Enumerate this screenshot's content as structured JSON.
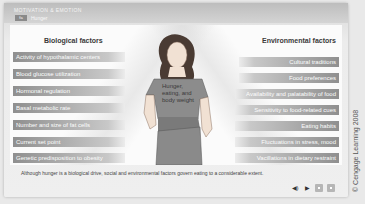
{
  "header": {
    "app_title": "Motivation & Emotion",
    "tab_badge": "fa",
    "tab_label": "Hunger"
  },
  "biological": {
    "title": "Biological factors",
    "items": [
      "Activity of hypothalamic centers",
      "Blood glucose utilization",
      "Hormonal regulation",
      "Basal metabolic rate",
      "Number and size of fat cells",
      "Current set point",
      "Genetic predisposition to obesity"
    ]
  },
  "environmental": {
    "title": "Environmental factors",
    "items": [
      "Cultural traditions",
      "Food preferences",
      "Availability and palatability of food",
      "Sensitivity to food-related cues",
      "Eating habits",
      "Fluctuations in stress, mood",
      "Vacillations in dietary restraint"
    ]
  },
  "figure": {
    "shirt_text": "Hunger, eating, and body weight"
  },
  "caption": "Although hunger is a biological drive, social and environmental factors govern eating to a considerable extent.",
  "controls": {
    "audio_icon": "◀)",
    "play_icon": "▶"
  },
  "copyright": "© Cengage Learning 2008",
  "colors": {
    "bar_dark": "#8f8f8f",
    "bar_light": "#c8c8c8",
    "panel_bg": "#fbfbfb",
    "header_bg": "#c4c4c4"
  }
}
